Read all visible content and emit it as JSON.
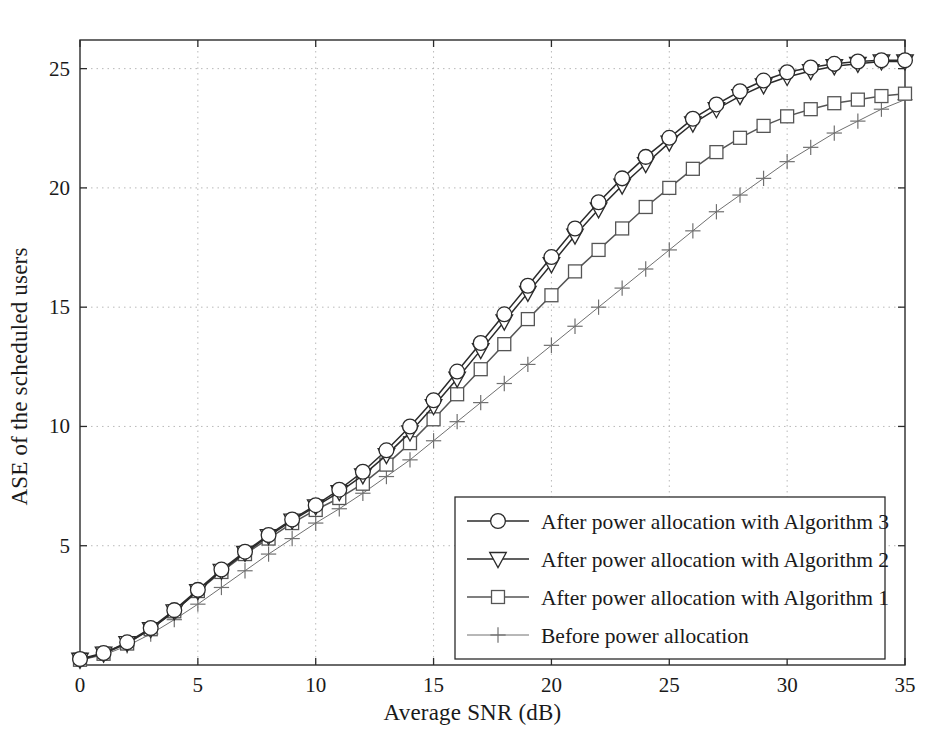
{
  "chart_data": {
    "type": "line",
    "title": "",
    "xlabel": "Average SNR (dB)",
    "ylabel": "ASE of the scheduled users",
    "xlim": [
      0,
      35
    ],
    "ylim": [
      0,
      26.2
    ],
    "xticks": [
      0,
      5,
      10,
      15,
      20,
      25,
      30,
      35
    ],
    "yticks": [
      5,
      10,
      15,
      20,
      25
    ],
    "grid": true,
    "legend_position": "lower-right-inside",
    "x": [
      0,
      1,
      2,
      3,
      4,
      5,
      6,
      7,
      8,
      9,
      10,
      11,
      12,
      13,
      14,
      15,
      16,
      17,
      18,
      19,
      20,
      21,
      22,
      23,
      24,
      25,
      26,
      27,
      28,
      29,
      30,
      31,
      32,
      33,
      34,
      35
    ],
    "series": [
      {
        "name": "After power allocation with Algorithm 3",
        "marker": "circle",
        "color": "#2b2b2b",
        "values": [
          0.25,
          0.5,
          0.95,
          1.55,
          2.3,
          3.15,
          4.0,
          4.75,
          5.45,
          6.1,
          6.7,
          7.35,
          8.1,
          9.0,
          10.0,
          11.1,
          12.3,
          13.5,
          14.7,
          15.9,
          17.1,
          18.3,
          19.4,
          20.4,
          21.3,
          22.1,
          22.9,
          23.5,
          24.05,
          24.5,
          24.85,
          25.05,
          25.2,
          25.3,
          25.35,
          25.35
        ]
      },
      {
        "name": "After power allocation with Algorithm 2",
        "marker": "triangle-down",
        "color": "#2b2b2b",
        "values": [
          0.22,
          0.48,
          0.92,
          1.5,
          2.25,
          3.1,
          3.95,
          4.7,
          5.4,
          6.05,
          6.65,
          7.25,
          7.95,
          8.8,
          9.75,
          10.85,
          12.0,
          13.2,
          14.4,
          15.6,
          16.8,
          18.0,
          19.1,
          20.1,
          21.0,
          21.9,
          22.7,
          23.3,
          23.85,
          24.3,
          24.65,
          24.9,
          25.1,
          25.2,
          25.3,
          25.3
        ]
      },
      {
        "name": "After power allocation with Algorithm 1",
        "marker": "square",
        "color": "#555555",
        "values": [
          0.22,
          0.47,
          0.9,
          1.5,
          2.25,
          3.1,
          3.9,
          4.65,
          5.3,
          5.95,
          6.5,
          7.0,
          7.6,
          8.4,
          9.3,
          10.3,
          11.35,
          12.4,
          13.45,
          14.5,
          15.5,
          16.5,
          17.4,
          18.3,
          19.2,
          20.0,
          20.8,
          21.5,
          22.1,
          22.6,
          23.0,
          23.3,
          23.55,
          23.7,
          23.85,
          23.95
        ]
      },
      {
        "name": "Before power allocation",
        "marker": "plus",
        "color": "#707070",
        "values": [
          0.2,
          0.42,
          0.8,
          1.3,
          1.9,
          2.55,
          3.25,
          3.95,
          4.65,
          5.3,
          5.95,
          6.55,
          7.2,
          7.9,
          8.6,
          9.4,
          10.2,
          11.0,
          11.8,
          12.6,
          13.4,
          14.2,
          15.0,
          15.8,
          16.6,
          17.4,
          18.2,
          19.0,
          19.7,
          20.4,
          21.1,
          21.7,
          22.3,
          22.8,
          23.3,
          23.7
        ]
      }
    ]
  },
  "axes": {
    "xtick_labels": [
      "0",
      "5",
      "10",
      "15",
      "20",
      "25",
      "30",
      "35"
    ],
    "ytick_labels": [
      "5",
      "10",
      "15",
      "20",
      "25"
    ]
  },
  "legend": {
    "entries": [
      {
        "label": "After power allocation with Algorithm 3",
        "marker": "circle"
      },
      {
        "label": "After power allocation with Algorithm 2",
        "marker": "triangle-down"
      },
      {
        "label": "After power allocation with Algorithm 1",
        "marker": "square"
      },
      {
        "label": "Before power allocation",
        "marker": "plus"
      }
    ]
  }
}
